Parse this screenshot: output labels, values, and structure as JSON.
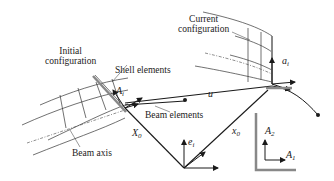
{
  "diagram": {
    "labels": {
      "initial_configuration": [
        "Initial",
        "configuration"
      ],
      "current_configuration": [
        "Current",
        "configuration"
      ],
      "shell_elements": "Shell elements",
      "beam_elements": "Beam elements",
      "beam_axis": "Beam axis"
    },
    "symbols": {
      "A_i": {
        "base": "A",
        "sub": "i"
      },
      "a_i": {
        "base": "a",
        "sub": "i"
      },
      "u": {
        "base": "u",
        "sub": ""
      },
      "X_0": {
        "base": "X",
        "sub": "0"
      },
      "x_0": {
        "base": "x",
        "sub": "0"
      },
      "e_i": {
        "base": "e",
        "sub": "i"
      },
      "A_1": {
        "base": "A",
        "sub": "1"
      },
      "A_2": {
        "base": "A",
        "sub": "2"
      }
    },
    "colors": {
      "line": "#1a1a1a",
      "mesh": "#333333",
      "plate": "#888888"
    }
  }
}
